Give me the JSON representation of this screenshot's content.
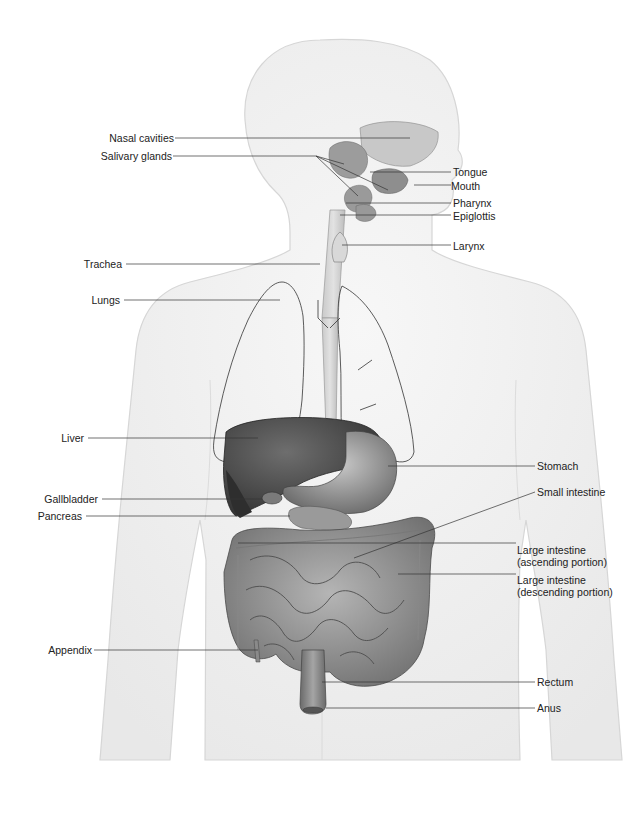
{
  "diagram": {
    "colors": {
      "body_fill": "#f0f0f0",
      "body_outline": "#d4d4d4",
      "organ_dark": "#4a4a4a",
      "organ_mid": "#8a8a8a",
      "organ_light": "#b8b8b8",
      "leader_line": "#333333",
      "text": "#222222"
    },
    "labels": {
      "nasal_cavities": "Nasal cavities",
      "salivary_glands": "Salivary glands",
      "tongue": "Tongue",
      "mouth": "Mouth",
      "pharynx": "Pharynx",
      "epiglottis": "Epiglottis",
      "larynx": "Larynx",
      "trachea": "Trachea",
      "lungs": "Lungs",
      "liver": "Liver",
      "stomach": "Stomach",
      "gallbladder": "Gallbladder",
      "small_intestine": "Small intestine",
      "pancreas": "Pancreas",
      "large_intestine_ascending_1": "Large intestine",
      "large_intestine_ascending_2": "(ascending portion)",
      "large_intestine_descending_1": "Large intestine",
      "large_intestine_descending_2": "(descending portion)",
      "appendix": "Appendix",
      "rectum": "Rectum",
      "anus": "Anus"
    }
  }
}
